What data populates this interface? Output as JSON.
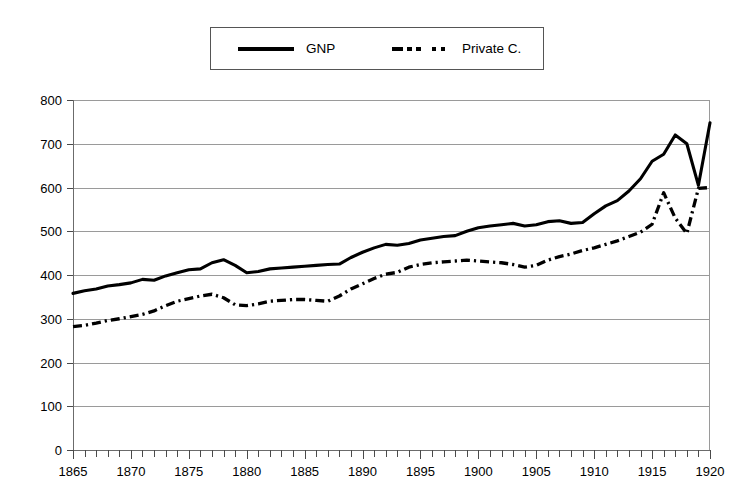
{
  "chart_data": {
    "type": "line",
    "title": "",
    "subtitle": "",
    "xlabel": "",
    "ylabel": "",
    "xlim": [
      1865,
      1920
    ],
    "ylim": [
      0,
      800
    ],
    "grid": true,
    "grid_axis": "y",
    "legend_position": "top-center",
    "y_ticks": [
      0,
      100,
      200,
      300,
      400,
      500,
      600,
      700,
      800
    ],
    "y_tick_labels": [
      "0",
      "100",
      "200",
      "300",
      "400",
      "500",
      "600",
      "700",
      "800"
    ],
    "x_ticks": [
      1865,
      1870,
      1875,
      1880,
      1885,
      1890,
      1895,
      1900,
      1905,
      1910,
      1915,
      1920
    ],
    "x_tick_labels": [
      "1865",
      "1870",
      "1875",
      "1880",
      "1885",
      "1890",
      "1895",
      "1900",
      "1905",
      "1910",
      "1915",
      "1920"
    ],
    "x_minor_tick_step": 1,
    "x": [
      1865,
      1866,
      1867,
      1868,
      1869,
      1870,
      1871,
      1872,
      1873,
      1874,
      1875,
      1876,
      1877,
      1878,
      1879,
      1880,
      1881,
      1882,
      1883,
      1884,
      1885,
      1886,
      1887,
      1888,
      1889,
      1890,
      1891,
      1892,
      1893,
      1894,
      1895,
      1896,
      1897,
      1898,
      1899,
      1900,
      1901,
      1902,
      1903,
      1904,
      1905,
      1906,
      1907,
      1908,
      1909,
      1910,
      1911,
      1912,
      1913,
      1914,
      1915,
      1916,
      1917,
      1918,
      1919,
      1920
    ],
    "series": [
      {
        "name": "GNP",
        "style": "solid",
        "color": "#000000",
        "values": [
          358,
          364,
          368,
          375,
          378,
          382,
          390,
          388,
          398,
          405,
          412,
          414,
          428,
          435,
          422,
          405,
          408,
          414,
          416,
          418,
          420,
          422,
          424,
          425,
          440,
          452,
          462,
          470,
          468,
          472,
          480,
          484,
          488,
          490,
          500,
          508,
          512,
          515,
          518,
          512,
          515,
          522,
          524,
          518,
          520,
          540,
          558,
          570,
          592,
          620,
          660,
          676,
          720,
          700,
          605,
          748
        ]
      },
      {
        "name": "Private C.",
        "style": "dash-dot",
        "color": "#000000",
        "values": [
          282,
          285,
          290,
          296,
          300,
          305,
          310,
          318,
          330,
          340,
          346,
          352,
          356,
          348,
          332,
          330,
          334,
          340,
          342,
          344,
          344,
          342,
          340,
          352,
          368,
          380,
          392,
          402,
          406,
          418,
          424,
          428,
          430,
          432,
          434,
          432,
          430,
          428,
          424,
          418,
          422,
          434,
          442,
          448,
          456,
          462,
          470,
          478,
          488,
          498,
          516,
          588,
          530,
          495,
          598,
          600
        ]
      }
    ]
  },
  "legend": {
    "entries": [
      {
        "label": "GNP",
        "style": "solid"
      },
      {
        "label": "Private C.",
        "style": "dash-dot"
      }
    ]
  },
  "caption": {
    "partial_text": ""
  }
}
